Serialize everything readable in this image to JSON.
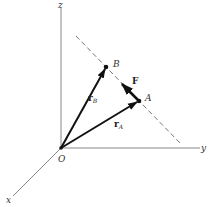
{
  "diagram": {
    "type": "3d-coordinate-vector-diagram",
    "axes": {
      "x_label": "x",
      "y_label": "y",
      "z_label": "z"
    },
    "points": {
      "origin_label": "O",
      "point_a_label": "A",
      "point_b_label": "B"
    },
    "vectors": {
      "r_a": {
        "main": "r",
        "sub": "A"
      },
      "r_b": {
        "main": "r",
        "sub": "B"
      },
      "force_label": "F"
    },
    "colors": {
      "axis": "#888888",
      "vector": "#111111",
      "dashed_line": "#777777",
      "background": "#ffffff"
    }
  }
}
